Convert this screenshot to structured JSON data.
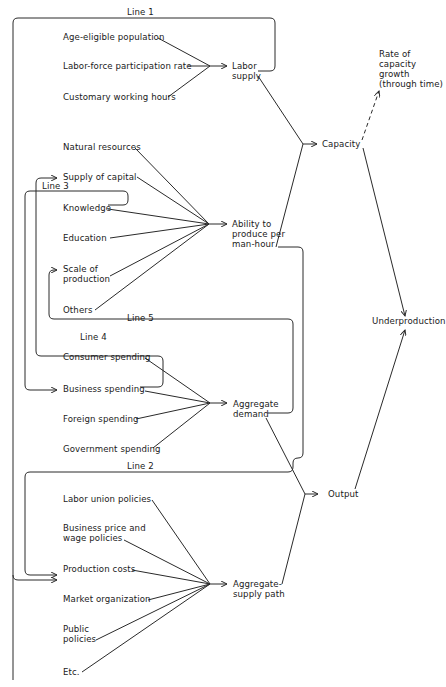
{
  "feedback_lines": {
    "line1": "Line 1",
    "line2": "Line 2",
    "line3": "Line 3",
    "line4": "Line 4",
    "line5": "Line 5"
  },
  "labor_inputs": [
    "Age-eligible population",
    "Labor-force participation rate",
    "Customary working hours"
  ],
  "labor_supply": "Labor\nsupply",
  "productivity_inputs": [
    "Natural resources",
    "Supply of capital",
    "Knowledge",
    "Education",
    "Scale of\nproduction",
    "Others"
  ],
  "productivity": "Ability to\nproduce per\nman-hour",
  "capacity": "Capacity",
  "capacity_growth": "Rate of\ncapacity\ngrowth\n(through time)",
  "demand_inputs": [
    "Consumer spending",
    "Business spending",
    "Foreign spending",
    "Government spending"
  ],
  "aggregate_demand": "Aggregate\ndemand",
  "supply_inputs": [
    "Labor union policies",
    "Business price and\nwage policies",
    "Production costs",
    "Market organization",
    "Public\npolicies",
    "Etc."
  ],
  "aggregate_supply": "Aggregate-\nsupply path",
  "output": "Output",
  "underproduction": "Underproduction"
}
